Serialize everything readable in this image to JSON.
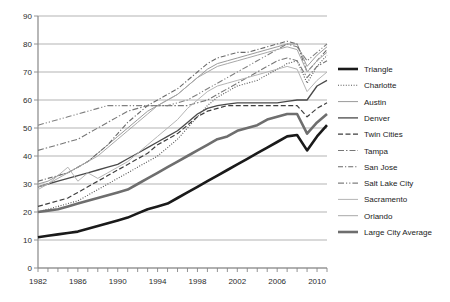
{
  "chart_data": {
    "type": "line",
    "title": "",
    "xlabel": "",
    "ylabel": "",
    "xlim": [
      1982,
      2011
    ],
    "ylim": [
      0,
      90
    ],
    "ytick_step": 10,
    "yticks": [
      0,
      10,
      20,
      30,
      40,
      50,
      60,
      70,
      80,
      90
    ],
    "xticks_labeled": [
      1982,
      1986,
      1990,
      1994,
      1998,
      2002,
      2006,
      2010
    ],
    "x": [
      1982,
      1983,
      1984,
      1985,
      1986,
      1987,
      1988,
      1989,
      1990,
      1991,
      1992,
      1993,
      1994,
      1995,
      1996,
      1997,
      1998,
      1999,
      2000,
      2001,
      2002,
      2003,
      2004,
      2005,
      2006,
      2007,
      2008,
      2009,
      2010,
      2011
    ],
    "grid": "horizontal",
    "legend_position": "right",
    "series": [
      {
        "name": "Triangle",
        "style": "solid",
        "width": 2.6,
        "color": "#1a1a1a",
        "values": [
          11,
          11.5,
          12,
          12.5,
          13,
          14,
          15,
          16,
          17,
          18,
          19.5,
          21,
          22,
          23,
          25,
          27,
          29,
          31,
          33,
          35,
          37,
          39,
          41,
          43,
          45,
          47,
          47.5,
          42,
          47,
          51
        ]
      },
      {
        "name": "Charlotte",
        "style": "dotted",
        "width": 1.1,
        "color": "#555555",
        "values": [
          20,
          21,
          22,
          23,
          24,
          26,
          28,
          30,
          32,
          34,
          36,
          38,
          40,
          43,
          46,
          50,
          54,
          58,
          61,
          63,
          65,
          66,
          67,
          69,
          71,
          73,
          74,
          66,
          72,
          76
        ]
      },
      {
        "name": "Austin",
        "style": "solid",
        "width": 1.0,
        "color": "#9a9a9a",
        "values": [
          30,
          31,
          33,
          34,
          36,
          38,
          41,
          44,
          47,
          50,
          53,
          56,
          58,
          60,
          62,
          65,
          68,
          71,
          73,
          74,
          75,
          76,
          77,
          78,
          79,
          80,
          80,
          72,
          76,
          79
        ]
      },
      {
        "name": "Denver",
        "style": "solid",
        "width": 1.3,
        "color": "#4a4a4a",
        "values": [
          29,
          30,
          31,
          32,
          33,
          34,
          35,
          36,
          37,
          39,
          41,
          43,
          45,
          47,
          49,
          52,
          55,
          57,
          58,
          58.5,
          59,
          59,
          59,
          59,
          59,
          59.5,
          60,
          60,
          65,
          67
        ]
      },
      {
        "name": "Twin Cities",
        "style": "dashed",
        "width": 1.2,
        "color": "#3f3f3f",
        "values": [
          22,
          23,
          24,
          25,
          27,
          29,
          31,
          33,
          35,
          37,
          39,
          41,
          44,
          46,
          48,
          51,
          54,
          56,
          57,
          58,
          58,
          58,
          58,
          58,
          58,
          58,
          58,
          54,
          57,
          59
        ]
      },
      {
        "name": "Tampa",
        "style": "dashdot",
        "width": 1.1,
        "color": "#777777",
        "values": [
          42,
          43,
          44,
          45,
          46,
          48,
          50,
          52,
          54,
          56,
          57,
          58,
          58,
          58,
          58,
          58,
          59,
          60,
          62,
          64,
          66,
          68,
          70,
          72,
          74,
          75,
          74,
          68,
          72,
          74
        ]
      },
      {
        "name": "San Jose",
        "style": "dashdot2",
        "width": 1.1,
        "color": "#6a6a6a",
        "values": [
          31,
          32,
          33,
          34,
          36,
          38,
          41,
          44,
          48,
          52,
          55,
          58,
          60,
          62,
          64,
          67,
          70,
          73,
          75,
          76,
          77,
          77,
          78,
          79,
          80,
          81,
          80,
          70,
          74,
          78
        ]
      },
      {
        "name": "Salt Lake City",
        "style": "dashdotdot",
        "width": 1.1,
        "color": "#808080",
        "values": [
          51,
          52,
          53,
          54,
          55,
          56,
          57,
          58,
          58,
          58,
          58,
          58,
          58,
          58,
          59,
          60,
          62,
          64,
          66,
          68,
          70,
          72,
          74,
          76,
          78,
          80,
          79,
          74,
          77,
          80
        ]
      },
      {
        "name": "Sacramento",
        "style": "solid",
        "width": 1.0,
        "color": "#b5b5b5",
        "values": [
          28,
          30,
          33,
          36,
          31,
          34,
          32,
          34,
          36,
          38,
          41,
          44,
          47,
          50,
          53,
          57,
          60,
          63,
          65,
          66,
          67,
          68,
          69,
          70,
          71,
          72,
          71,
          63,
          67,
          70
        ]
      },
      {
        "name": "Orlando",
        "style": "solid",
        "width": 1.0,
        "color": "#a8a8a8",
        "values": [
          29,
          30,
          32,
          34,
          36,
          38,
          40,
          43,
          46,
          49,
          52,
          55,
          58,
          60,
          62,
          65,
          68,
          70,
          72,
          73,
          74,
          75,
          76,
          77,
          78,
          79,
          78,
          70,
          74,
          77
        ]
      },
      {
        "name": "Large City Average",
        "style": "solid",
        "width": 2.6,
        "color": "#6e6e6e",
        "values": [
          20,
          20.5,
          21,
          22,
          23,
          24,
          25,
          26,
          27,
          28,
          30,
          32,
          34,
          36,
          38,
          40,
          42,
          44,
          46,
          47,
          49,
          50,
          51,
          53,
          54,
          55,
          55,
          48,
          52,
          55
        ]
      }
    ]
  },
  "axes": {
    "ylabels": [
      "90",
      "80",
      "70",
      "60",
      "50",
      "40",
      "30",
      "20",
      "10",
      "0"
    ],
    "xlabels": [
      "1982",
      "1986",
      "1990",
      "1994",
      "1998",
      "2002",
      "2006",
      "2010"
    ]
  },
  "legend": {
    "items": [
      {
        "label": "Triangle"
      },
      {
        "label": "Charlotte"
      },
      {
        "label": "Austin"
      },
      {
        "label": "Denver"
      },
      {
        "label": "Twin Cities"
      },
      {
        "label": "Tampa"
      },
      {
        "label": "San Jose"
      },
      {
        "label": "Salt Lake City"
      },
      {
        "label": "Sacramento"
      },
      {
        "label": "Orlando"
      },
      {
        "label": "Large City Average"
      }
    ]
  },
  "colors": {
    "grid": "#aaaaaa",
    "axis": "#888888",
    "text": "#2b2b2b"
  }
}
